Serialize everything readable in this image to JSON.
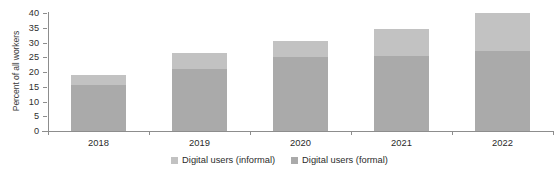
{
  "chart_data": {
    "type": "bar",
    "subtype": "stacked-vertical",
    "title": "",
    "xlabel": "",
    "ylabel": "Percent of all workers",
    "categories": [
      "2018",
      "2019",
      "2020",
      "2021",
      "2022"
    ],
    "ylim": [
      0,
      40
    ],
    "yticks": [
      0,
      5,
      10,
      15,
      20,
      25,
      30,
      35,
      40
    ],
    "grid": false,
    "legend_position": "bottom-center",
    "series": [
      {
        "name": "Digital users (formal)",
        "color": "#aaaaaa",
        "values": [
          15.5,
          21,
          25,
          25.5,
          27
        ]
      },
      {
        "name": "Digital users (informal)",
        "color": "#c2c2c2",
        "values": [
          3.5,
          5.5,
          5.5,
          9,
          13
        ]
      }
    ],
    "totals": [
      19,
      26.5,
      30.5,
      34.5,
      40
    ],
    "legend_entries": [
      {
        "label": "Digital users (informal)",
        "color": "#c2c2c2"
      },
      {
        "label": "Digital users (formal)",
        "color": "#aaaaaa"
      }
    ]
  },
  "axis": {
    "y_title": "Percent of all workers",
    "y_tick_labels": [
      "40",
      "35",
      "30",
      "25",
      "20",
      "15",
      "10",
      "5",
      "0"
    ],
    "x_tick_labels": [
      "2018",
      "2019",
      "2020",
      "2021",
      "2022"
    ]
  }
}
